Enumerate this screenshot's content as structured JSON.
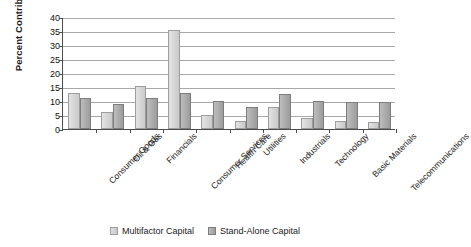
{
  "chart_data": {
    "type": "bar",
    "title": "",
    "xlabel": "",
    "ylabel": "Percent Contribution",
    "ylim": [
      0,
      40
    ],
    "ytick_step": 5,
    "yticks": [
      40,
      35,
      30,
      25,
      20,
      15,
      10,
      5,
      0
    ],
    "grid": true,
    "legend_position": "bottom-center",
    "categories": [
      "Consumer Goods",
      "Oil & Gas",
      "Financials",
      "Consumer Services",
      "Health Care",
      "Utilities",
      "Industrials",
      "Technology",
      "Basic Materials",
      "Telecommunications"
    ],
    "series": [
      {
        "name": "Multifactor Capital",
        "color": "#d6d6d6",
        "values": [
          13.0,
          6.0,
          15.2,
          35.2,
          5.0,
          3.0,
          8.0,
          4.0,
          3.0,
          2.5
        ]
      },
      {
        "name": "Stand-Alone Capital",
        "color": "#a8a8a8",
        "values": [
          11.0,
          9.0,
          11.0,
          13.0,
          10.0,
          8.0,
          12.5,
          10.0,
          9.5,
          9.5
        ]
      }
    ]
  },
  "axis": {
    "line_color": "#4d4d4d",
    "grid_color": "#a8a8a8"
  }
}
